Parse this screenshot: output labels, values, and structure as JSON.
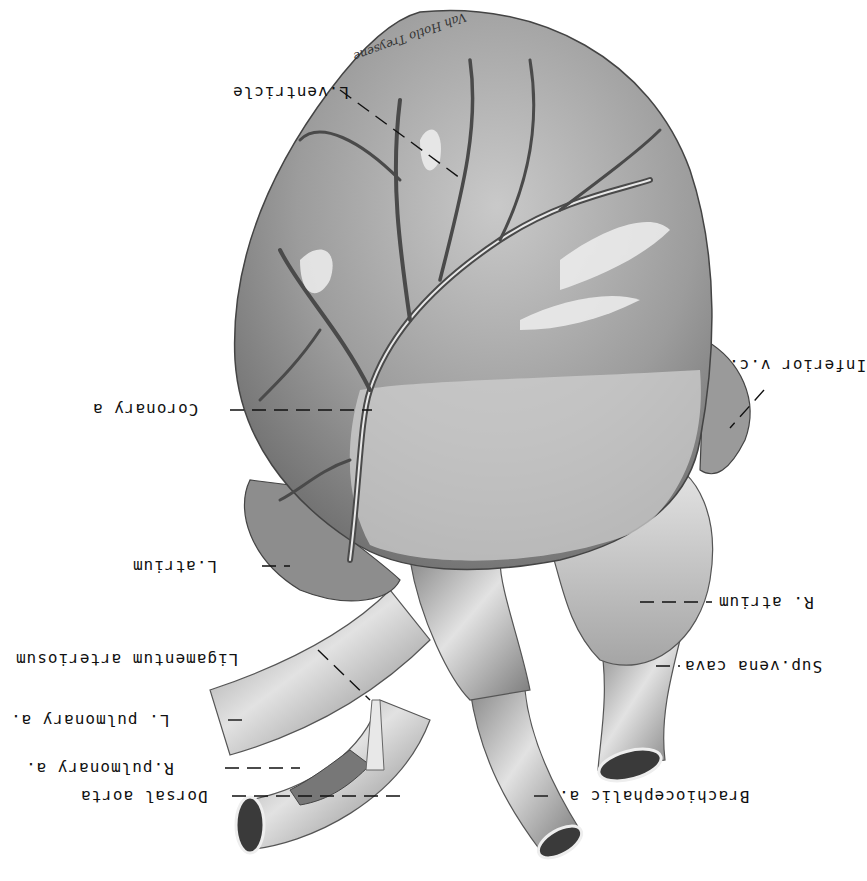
{
  "figure": {
    "orientation": "rotated 180 degrees",
    "colors": {
      "background": "#ffffff",
      "ink": "#111111",
      "tissue_light": "#d9d9d9",
      "tissue_mid": "#9a9a9a",
      "tissue_dark": "#5a5a5a"
    },
    "signature": "Vah Hotlo Treysene"
  },
  "labels": [
    {
      "id": "l-ventricle",
      "text": "L.ventricle"
    },
    {
      "id": "coronary-a",
      "text": "Coronary a"
    },
    {
      "id": "inferior-vc",
      "text": "Inferior v.c."
    },
    {
      "id": "l-atrium",
      "text": "L.atrium"
    },
    {
      "id": "r-atrium",
      "text": "R. atrium"
    },
    {
      "id": "ligamentum",
      "text": "Ligamentum arteriosum"
    },
    {
      "id": "sup-vena-cava",
      "text": "Sup.vena cava"
    },
    {
      "id": "l-pulmonary",
      "text": "L. pulmonary a."
    },
    {
      "id": "r-pulmonary",
      "text": "R.pulmonary a."
    },
    {
      "id": "dorsal-aorta",
      "text": "Dorsal aorta"
    },
    {
      "id": "brachiocephalic",
      "text": "Brachiocephalic a."
    }
  ]
}
